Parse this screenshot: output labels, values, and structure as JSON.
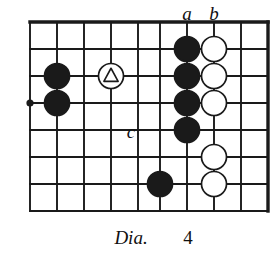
{
  "figure": {
    "kind": "go-board-diagram",
    "caption_word": "Dia.",
    "caption_number": "4",
    "background_color": "#ffffff",
    "line_color": "#1a1a1a",
    "black_stone_color": "#1a1a1a",
    "white_stone_color": "#ffffff"
  },
  "board": {
    "vertical_lines_x": [
      30,
      57,
      84,
      111,
      138,
      160,
      187,
      214,
      241,
      268
    ],
    "horizontal_lines_y": [
      22,
      49,
      76,
      103,
      130,
      157,
      184,
      211
    ],
    "thick_edges": [
      "top",
      "right"
    ],
    "star_points": [
      {
        "x": 30,
        "y": 103
      }
    ]
  },
  "stones": {
    "black": [
      {
        "x": 57,
        "y": 76
      },
      {
        "x": 57,
        "y": 103
      },
      {
        "x": 187,
        "y": 49
      },
      {
        "x": 187,
        "y": 76
      },
      {
        "x": 187,
        "y": 103
      },
      {
        "x": 187,
        "y": 130
      },
      {
        "x": 160,
        "y": 184
      }
    ],
    "white": [
      {
        "x": 214,
        "y": 49
      },
      {
        "x": 214,
        "y": 76
      },
      {
        "x": 214,
        "y": 103
      },
      {
        "x": 214,
        "y": 157
      },
      {
        "x": 214,
        "y": 184
      }
    ],
    "white_marked_triangle": [
      {
        "x": 111,
        "y": 76
      }
    ],
    "radius": 12.5
  },
  "point_labels": [
    {
      "text": "a",
      "x": 187,
      "y": 13
    },
    {
      "text": "b",
      "x": 214,
      "y": 13
    },
    {
      "text": "c",
      "x": 131,
      "y": 131
    }
  ],
  "caption": {
    "word_x": 131,
    "word_y": 237,
    "number_x": 188,
    "number_y": 237
  }
}
